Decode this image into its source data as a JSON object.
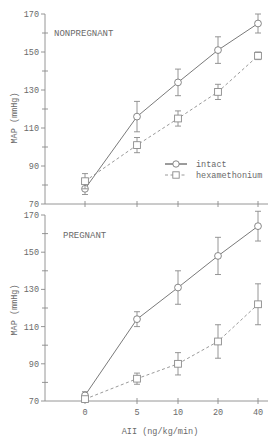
{
  "chart_data": [
    {
      "type": "line",
      "title": "NONPREGNANT",
      "xlabel": "AII (ng/kg/min)",
      "ylabel": "MAP (mmHg)",
      "x_categories": [
        "0",
        "5",
        "10",
        "20",
        "40"
      ],
      "ylim": [
        70,
        170
      ],
      "y_ticks": [
        70,
        90,
        110,
        130,
        150,
        170
      ],
      "grid": false,
      "legend_position": "lower-right of top panel",
      "series": [
        {
          "name": "intact",
          "marker": "circle",
          "line": "solid",
          "values": [
            78,
            116,
            134,
            151,
            165
          ],
          "error": [
            3,
            8,
            7,
            7,
            5
          ]
        },
        {
          "name": "hexamethonium",
          "marker": "square",
          "line": "dashed",
          "values": [
            82,
            101,
            115,
            129,
            148
          ],
          "error": [
            4,
            4,
            4,
            4,
            2
          ]
        }
      ]
    },
    {
      "type": "line",
      "title": "PREGNANT",
      "xlabel": "AII (ng/kg/min)",
      "ylabel": "MAP (mmHg)",
      "x_categories": [
        "0",
        "5",
        "10",
        "20",
        "40"
      ],
      "ylim": [
        70,
        170
      ],
      "y_ticks": [
        70,
        90,
        110,
        130,
        150,
        170
      ],
      "grid": false,
      "series": [
        {
          "name": "intact",
          "marker": "circle",
          "line": "solid",
          "values": [
            73,
            114,
            131,
            148,
            164
          ],
          "error": [
            2,
            4,
            9,
            10,
            8
          ]
        },
        {
          "name": "hexamethonium",
          "marker": "square",
          "line": "dashed",
          "values": [
            71,
            82,
            90,
            102,
            122
          ],
          "error": [
            1,
            3,
            6,
            9,
            11
          ]
        }
      ]
    }
  ],
  "panels": {
    "top": {
      "label": "NONPREGNANT"
    },
    "bottom": {
      "label": "PREGNANT"
    }
  },
  "axes": {
    "ylabel": "MAP (mmHg)",
    "xlabel": "AII (ng/kg/min)",
    "y_tick_labels": [
      "170",
      "150",
      "130",
      "110",
      "90",
      "70"
    ],
    "x_tick_labels": [
      "0",
      "5",
      "10",
      "20",
      "40"
    ]
  },
  "legend": {
    "intact": "intact",
    "hexamethonium": "hexamethonium"
  }
}
